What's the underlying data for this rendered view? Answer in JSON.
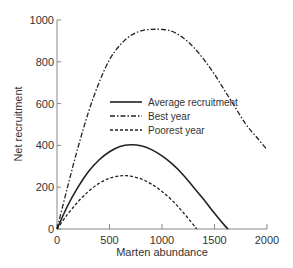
{
  "chart_data": {
    "type": "line",
    "title": "",
    "xlabel": "Marten abundance",
    "ylabel": "Net recruitment",
    "xlim": [
      0,
      2000
    ],
    "ylim": [
      0,
      1000
    ],
    "x_ticks": [
      0,
      500,
      1000,
      1500,
      2000
    ],
    "y_ticks": [
      0,
      200,
      400,
      600,
      800,
      1000
    ],
    "grid": false,
    "legend_position": "center-right (inside plot)",
    "series": [
      {
        "name": "Average recruitment",
        "style": "solid",
        "x": [
          0,
          100,
          200,
          300,
          400,
          500,
          600,
          700,
          800,
          900,
          1000,
          1100,
          1200,
          1300,
          1400,
          1500,
          1600,
          1630
        ],
        "y": [
          0,
          110,
          200,
          275,
          330,
          370,
          395,
          403,
          398,
          380,
          350,
          310,
          260,
          200,
          140,
          75,
          15,
          0
        ]
      },
      {
        "name": "Best year",
        "style": "dash-dot",
        "x": [
          0,
          100,
          200,
          300,
          400,
          500,
          600,
          700,
          800,
          900,
          1000,
          1100,
          1200,
          1300,
          1400,
          1500,
          1600,
          1700,
          1800,
          1900,
          2000
        ],
        "y": [
          0,
          200,
          390,
          560,
          700,
          810,
          880,
          925,
          948,
          955,
          955,
          945,
          915,
          870,
          810,
          740,
          660,
          580,
          500,
          440,
          380
        ]
      },
      {
        "name": "Poorest year",
        "style": "dashed",
        "x": [
          0,
          100,
          200,
          300,
          400,
          500,
          600,
          650,
          700,
          800,
          900,
          1000,
          1100,
          1200,
          1300,
          1330
        ],
        "y": [
          0,
          70,
          130,
          180,
          218,
          243,
          254,
          255,
          253,
          240,
          215,
          180,
          135,
          80,
          20,
          0
        ]
      }
    ]
  }
}
